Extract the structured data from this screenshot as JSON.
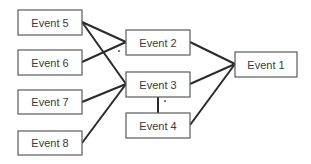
{
  "diagram": {
    "type": "event-network",
    "nodes": [
      {
        "id": "e5",
        "label": "Event 5",
        "x": 18,
        "y": 10,
        "w": 64,
        "h": 25
      },
      {
        "id": "e6",
        "label": "Event 6",
        "x": 18,
        "y": 50,
        "w": 64,
        "h": 25
      },
      {
        "id": "e7",
        "label": "Event 7",
        "x": 18,
        "y": 90,
        "w": 64,
        "h": 24
      },
      {
        "id": "e8",
        "label": "Event 8",
        "x": 18,
        "y": 131,
        "w": 64,
        "h": 24
      },
      {
        "id": "e2",
        "label": "Event 2",
        "x": 126,
        "y": 30,
        "w": 64,
        "h": 25
      },
      {
        "id": "e3",
        "label": "Event 3",
        "x": 126,
        "y": 72,
        "w": 64,
        "h": 25
      },
      {
        "id": "e4",
        "label": "Event 4",
        "x": 126,
        "y": 113,
        "w": 64,
        "h": 25
      },
      {
        "id": "e1",
        "label": "Event 1",
        "x": 235,
        "y": 52,
        "w": 62,
        "h": 25
      }
    ],
    "edges": [
      {
        "from": "e5",
        "to": "e2"
      },
      {
        "from": "e5",
        "to": "e3"
      },
      {
        "from": "e6",
        "to": "e2"
      },
      {
        "from": "e7",
        "to": "e3"
      },
      {
        "from": "e8",
        "to": "e3"
      },
      {
        "from": "e2",
        "to": "e1"
      },
      {
        "from": "e3",
        "to": "e1"
      },
      {
        "from": "e4",
        "to": "e1"
      },
      {
        "from": "e3",
        "to": "e4"
      }
    ],
    "markers": [
      {
        "label": "·",
        "x": 119,
        "y": 51
      },
      {
        "label": "·",
        "x": 165,
        "y": 101
      }
    ]
  }
}
